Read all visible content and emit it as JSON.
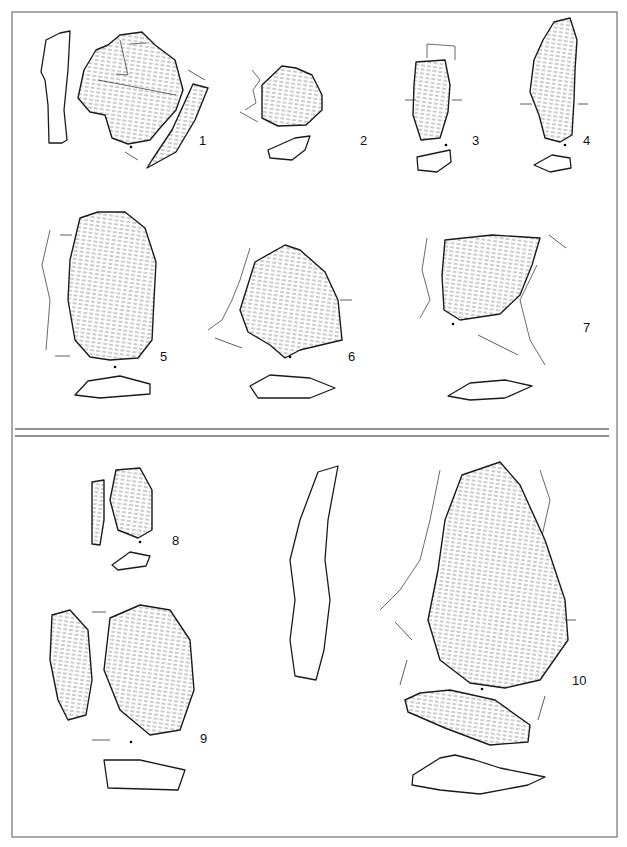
{
  "plate": {
    "type": "archaeological lithic illustration plate",
    "sections": 2,
    "artifact_labels": [
      "1",
      "2",
      "3",
      "4",
      "5",
      "6",
      "7",
      "8",
      "9",
      "10"
    ]
  },
  "colors": {
    "ink": "#1a1a1a",
    "paper": "#ffffff",
    "frame": "#555555"
  }
}
